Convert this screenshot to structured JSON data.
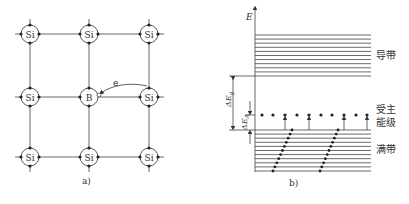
{
  "panel_a": {
    "caption": "a)",
    "atoms": [
      {
        "symbol": "Si",
        "row": 0,
        "col": 0
      },
      {
        "symbol": "Si",
        "row": 0,
        "col": 1
      },
      {
        "symbol": "Si",
        "row": 0,
        "col": 2
      },
      {
        "symbol": "Si",
        "row": 1,
        "col": 0
      },
      {
        "symbol": "B",
        "row": 1,
        "col": 1
      },
      {
        "symbol": "Si",
        "row": 1,
        "col": 2
      },
      {
        "symbol": "Si",
        "row": 2,
        "col": 0
      },
      {
        "symbol": "Si",
        "row": 2,
        "col": 1
      },
      {
        "symbol": "Si",
        "row": 2,
        "col": 2
      }
    ],
    "electron_label": "e"
  },
  "panel_b": {
    "caption": "b)",
    "axis_label": "E",
    "conduction_band_label": "导带",
    "acceptor_level_label_line1": "受主",
    "acceptor_level_label_line2": "能级",
    "valence_band_label": "满带",
    "gap_label": "ΔE",
    "gap_subscript": "g",
    "acceptor_energy_label": "ΔE",
    "acceptor_energy_subscript": "A"
  },
  "colors": {
    "line": "#333333",
    "background": "#ffffff"
  }
}
